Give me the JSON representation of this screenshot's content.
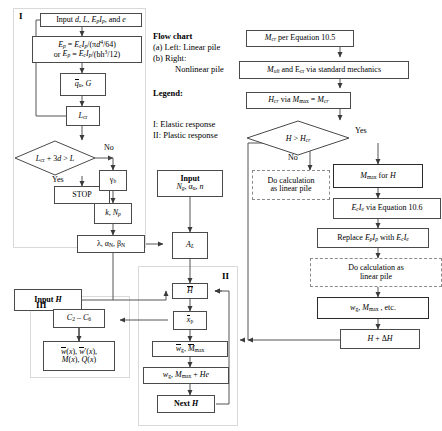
{
  "legend": {
    "heading_flowchart": "Flow chart",
    "line_a": "(a) Left: Linear pile",
    "line_b": "(b) Right:",
    "line_b2": "Nonlinear pile",
    "heading_legend": "Legend:",
    "item_I": "I: Elastic response",
    "item_II": "II: Plastic response"
  },
  "groups": {
    "I": "I",
    "II": "II",
    "III": "III"
  },
  "left_column": {
    "input_props": "Input d, L, EpIp, and e",
    "modulus_eq_line1": "Ep = EcIp/(πd⁴/64)",
    "modulus_eq_line2": "or Ep = EcIp/(bh³/12)",
    "qu_G": "q̄u, G",
    "Lcr": "Lcr",
    "decision": "Lcr + 3d > L",
    "yes_label": "Yes",
    "no_label": "No",
    "stop": "STOP",
    "gamma_b": "γb",
    "k_Np": "k, Np",
    "lambda_alpha_beta": "λ, αN, βN"
  },
  "middle_column": {
    "input_heading": "Input",
    "input_vars": "Ng, αu, n",
    "A_L": "AL",
    "H_bar": "H̄",
    "x_p_bar": "x̄p",
    "wg_Mmax_bar": "w̄g, M̄max",
    "wg_Mmax_He": "wg Mmax + He",
    "next_H": "Next H",
    "input_H": "Input H"
  },
  "section_III": {
    "constants": "C₂ – C₆",
    "outputs_line1": "w̄(x), w̄′(x),",
    "outputs_line2": "M(x), Q(x)"
  },
  "right_column": {
    "Mcr": "Mcr per Equation 10.5",
    "Mult_Ecr": "Mult and Ecr via standard mechanics",
    "Hcr": "Hcr via Mmax = Mcr",
    "decision": "H > Hcr",
    "yes_label": "Yes",
    "no_label": "No",
    "do_calc_linear_left_line1": "Do calculation",
    "do_calc_linear_left_line2": "as linear pile",
    "Mmax_for_H": "Mmax for H",
    "EcIe": "EcIe via Equation 10.6",
    "replace": "Replace EpIp with EcIe",
    "do_calc_linear_line1": "Do calculation as",
    "do_calc_linear_line2": "linear pile",
    "wg_Mmax_etc": "wg Mmax , etc.",
    "H_plus_dH": "H + ΔH"
  },
  "colors": {
    "box_border": "#4a4a4a",
    "thick_border": "#2a2a2a",
    "dashed_border": "#8a8a8a",
    "group_border": "#d9d9d9",
    "wire": "#555555",
    "text": "#000000",
    "background": "#ffffff"
  }
}
